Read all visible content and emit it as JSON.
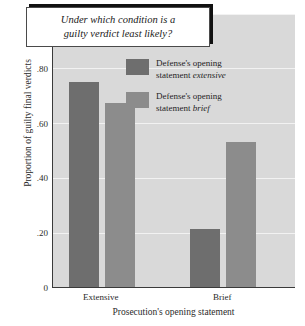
{
  "chart_data": {
    "type": "bar",
    "title": "Under which condition is a guilty verdict least likely?",
    "title_line1": "Under which condition is a",
    "title_line2": "guilty verdict least likely?",
    "xlabel": "Prosecution's opening statement",
    "ylabel": "Proportion of guilty final verdicts",
    "categories": [
      "Extensive",
      "Brief"
    ],
    "series": [
      {
        "name": "Defense's opening statement extensive",
        "label_line1": "Defense's opening",
        "label_line2_plain": "statement ",
        "label_line2_em": "extensive",
        "color": "#6e6e6e",
        "values": [
          0.75,
          0.21
        ]
      },
      {
        "name": "Defense's opening statement brief",
        "label_line1": "Defense's opening",
        "label_line2_plain": "statement ",
        "label_line2_em": "brief",
        "color": "#8c8c8c",
        "values": [
          0.67,
          0.53
        ]
      }
    ],
    "ylim": [
      0,
      1.0
    ],
    "yticks": [
      0,
      0.2,
      0.4,
      0.6,
      0.8,
      1.0
    ],
    "ytick_labels": [
      "0",
      ".20",
      ".40",
      ".60",
      ".80",
      "1.00"
    ],
    "grid": true,
    "grid_color": "#f2f2f2",
    "plot_background": "#d9d9d9",
    "figure_background": "#ffffff",
    "legend_position": "upper right inside"
  }
}
